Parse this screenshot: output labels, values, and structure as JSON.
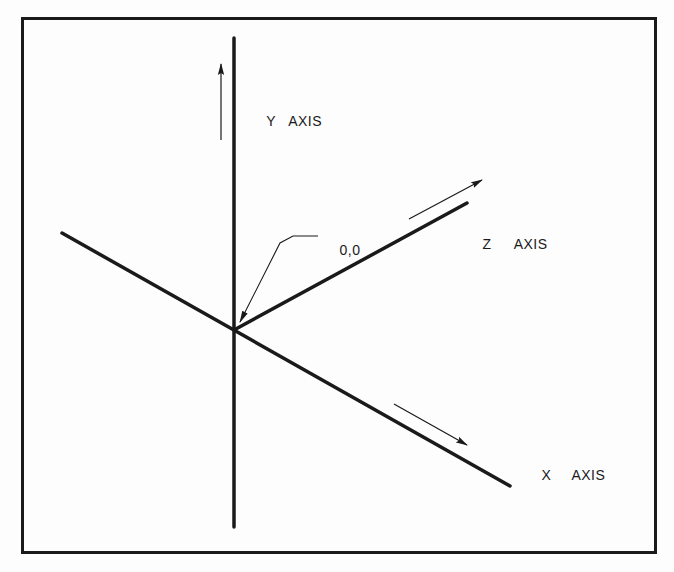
{
  "diagram": {
    "colors": {
      "background": "#fdfdfd",
      "line": "#1a1a1a",
      "frame": "#1a1a1a"
    },
    "frame": {
      "x": 21,
      "y": 17,
      "width": 635,
      "height": 537,
      "stroke_width": 3
    },
    "origin": {
      "label": "0,0",
      "x": 234,
      "y": 330
    },
    "axes": [
      {
        "id": "y",
        "letter": "Y",
        "word": "AXIS",
        "line": {
          "x1": 234,
          "y1": 38,
          "x2": 234,
          "y2": 527
        },
        "arrow": {
          "x1": 221,
          "y1": 140,
          "x2": 221,
          "y2": 64
        },
        "label_pos": {
          "x": 249,
          "y": 100
        }
      },
      {
        "id": "z",
        "letter": "Z",
        "word": "AXIS",
        "line": {
          "x1": 234,
          "y1": 330,
          "x2": 467,
          "y2": 203
        },
        "arrow": {
          "x1": 409,
          "y1": 219,
          "x2": 482,
          "y2": 180
        },
        "label_pos": {
          "x": 465,
          "y": 223
        }
      },
      {
        "id": "x",
        "letter": "X",
        "word": "AXIS",
        "line": {
          "x1": 62,
          "y1": 233,
          "x2": 510,
          "y2": 486
        },
        "arrow": {
          "x1": 394,
          "y1": 404,
          "x2": 467,
          "y2": 445
        },
        "label_pos": {
          "x": 524,
          "y": 454
        }
      }
    ],
    "origin_leader": {
      "points": "333,236 293,236 280,243 240,322",
      "label_pos": {
        "x": 322,
        "y": 229
      }
    }
  }
}
